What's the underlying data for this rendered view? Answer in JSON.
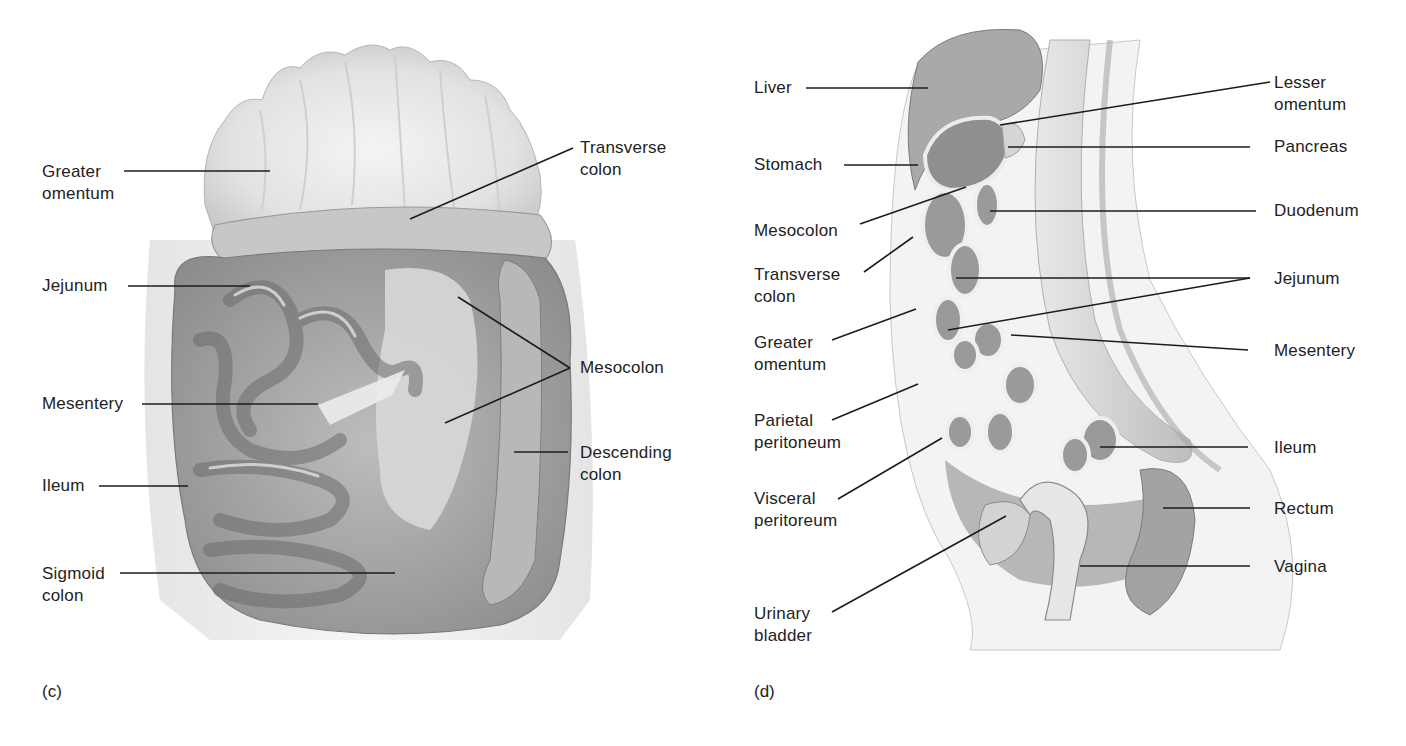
{
  "figure": {
    "panels": [
      {
        "id": "c",
        "panel_label": "(c)",
        "view": "anterior view of abdominal organs",
        "labels": [
          {
            "key": "greater_omentum",
            "lines": [
              "Greater",
              "omentum"
            ]
          },
          {
            "key": "jejunum",
            "lines": [
              "Jejunum"
            ]
          },
          {
            "key": "mesentery",
            "lines": [
              "Mesentery"
            ]
          },
          {
            "key": "ileum",
            "lines": [
              "Ileum"
            ]
          },
          {
            "key": "sigmoid_colon",
            "lines": [
              "Sigmoid",
              "colon"
            ]
          },
          {
            "key": "transverse_colon",
            "lines": [
              "Transverse",
              "colon"
            ]
          },
          {
            "key": "mesocolon",
            "lines": [
              "Mesocolon"
            ]
          },
          {
            "key": "descending_colon",
            "lines": [
              "Descending",
              "colon"
            ]
          }
        ]
      },
      {
        "id": "d",
        "panel_label": "(d)",
        "view": "midsagittal section of abdominopelvic cavity",
        "labels": [
          {
            "key": "liver",
            "lines": [
              "Liver"
            ]
          },
          {
            "key": "stomach",
            "lines": [
              "Stomach"
            ]
          },
          {
            "key": "mesocolon",
            "lines": [
              "Mesocolon"
            ]
          },
          {
            "key": "transverse_colon",
            "lines": [
              "Transverse",
              "colon"
            ]
          },
          {
            "key": "greater_omentum",
            "lines": [
              "Greater",
              "omentum"
            ]
          },
          {
            "key": "parietal_peritoneum",
            "lines": [
              "Parietal",
              "peritoneum"
            ]
          },
          {
            "key": "visceral_peritoneum",
            "lines": [
              "Visceral",
              "peritoreum"
            ]
          },
          {
            "key": "urinary_bladder",
            "lines": [
              "Urinary",
              "bladder"
            ]
          },
          {
            "key": "lesser_omentum",
            "lines": [
              "Lesser",
              "omentum"
            ]
          },
          {
            "key": "pancreas",
            "lines": [
              "Pancreas"
            ]
          },
          {
            "key": "duodenum",
            "lines": [
              "Duodenum"
            ]
          },
          {
            "key": "jejunum",
            "lines": [
              "Jejunum"
            ]
          },
          {
            "key": "mesentery",
            "lines": [
              "Mesentery"
            ]
          },
          {
            "key": "ileum",
            "lines": [
              "Ileum"
            ]
          },
          {
            "key": "rectum",
            "lines": [
              "Rectum"
            ]
          },
          {
            "key": "vagina",
            "lines": [
              "Vagina"
            ]
          }
        ]
      }
    ],
    "colors": {
      "background": "#ffffff",
      "text": "#222222",
      "leader_line": "#1c1c1c",
      "tissue_light": "#e4e4e4",
      "tissue_mid": "#c2c2c2",
      "tissue_dark": "#8e8e8e"
    }
  }
}
